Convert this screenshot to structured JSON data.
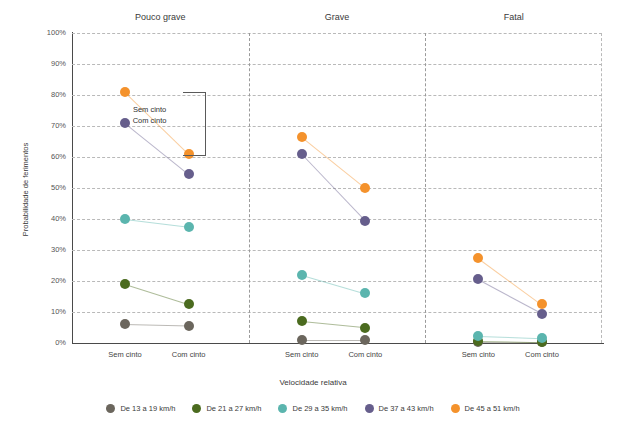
{
  "chart_data": {
    "type": "scatter",
    "title": "",
    "xlabel": "Velocidade relativa",
    "ylabel": "Probabilidade de ferimentos",
    "ylim": [
      0,
      100
    ],
    "ytick_labels": [
      "0%",
      "10%",
      "20%",
      "30%",
      "40%",
      "50%",
      "60%",
      "70%",
      "80%",
      "90%",
      "100%"
    ],
    "ytick_values": [
      0,
      10,
      20,
      30,
      40,
      50,
      60,
      70,
      80,
      90,
      100
    ],
    "grid": true,
    "legend_position": "bottom",
    "x_categories": [
      "Sem cinto",
      "Com cinto"
    ],
    "panels": [
      {
        "title": "Pouco grave",
        "series": [
          {
            "name": "De 13 a 19 km/h",
            "color": "#6b665d",
            "values": [
              6.0,
              5.5
            ]
          },
          {
            "name": "De 21 a 27 km/h",
            "color": "#4b6b1f",
            "values": [
              19.0,
              12.5
            ]
          },
          {
            "name": "De 29 a 35 km/h",
            "color": "#5bb5ae",
            "values": [
              40.0,
              37.5
            ]
          },
          {
            "name": "De 37 a 43 km/h",
            "color": "#665e8c",
            "values": [
              71.0,
              54.5
            ]
          },
          {
            "name": "De 45 a 51 km/h",
            "color": "#f4922c",
            "values": [
              81.0,
              61.0
            ]
          }
        ]
      },
      {
        "title": "Grave",
        "series": [
          {
            "name": "De 13 a 19 km/h",
            "color": "#6b665d",
            "values": [
              1.0,
              1.0
            ]
          },
          {
            "name": "De 21 a 27 km/h",
            "color": "#4b6b1f",
            "values": [
              7.0,
              5.0
            ]
          },
          {
            "name": "De 29 a 35 km/h",
            "color": "#5bb5ae",
            "values": [
              22.0,
              16.0
            ]
          },
          {
            "name": "De 37 a 43 km/h",
            "color": "#665e8c",
            "values": [
              61.0,
              39.5
            ]
          },
          {
            "name": "De 45 a 51 km/h",
            "color": "#f4922c",
            "values": [
              66.5,
              50.0
            ]
          }
        ]
      },
      {
        "title": "Fatal",
        "series": [
          {
            "name": "De 13 a 19 km/h",
            "color": "#6b665d",
            "values": [
              0.3,
              0.2
            ]
          },
          {
            "name": "De 21 a 27 km/h",
            "color": "#4b6b1f",
            "values": [
              0.8,
              0.4
            ]
          },
          {
            "name": "De 29 a 35 km/h",
            "color": "#5bb5ae",
            "values": [
              2.2,
              1.5
            ]
          },
          {
            "name": "De 37 a 43 km/h",
            "color": "#665e8c",
            "values": [
              20.5,
              9.5
            ]
          },
          {
            "name": "De 45 a 51 km/h",
            "color": "#f4922c",
            "values": [
              27.5,
              12.5
            ]
          }
        ]
      }
    ],
    "legend": [
      {
        "label": "De 13 a 19 km/h",
        "color": "#6b665d"
      },
      {
        "label": "De 21 a 27 km/h",
        "color": "#4b6b1f"
      },
      {
        "label": "De 29 a 35 km/h",
        "color": "#5bb5ae"
      },
      {
        "label": "De 37 a 43 km/h",
        "color": "#665e8c"
      },
      {
        "label": "De 45 a 51 km/h",
        "color": "#f4922c"
      }
    ],
    "annotation": {
      "line1": "Sem cinto",
      "line2": "Com cinto"
    }
  }
}
